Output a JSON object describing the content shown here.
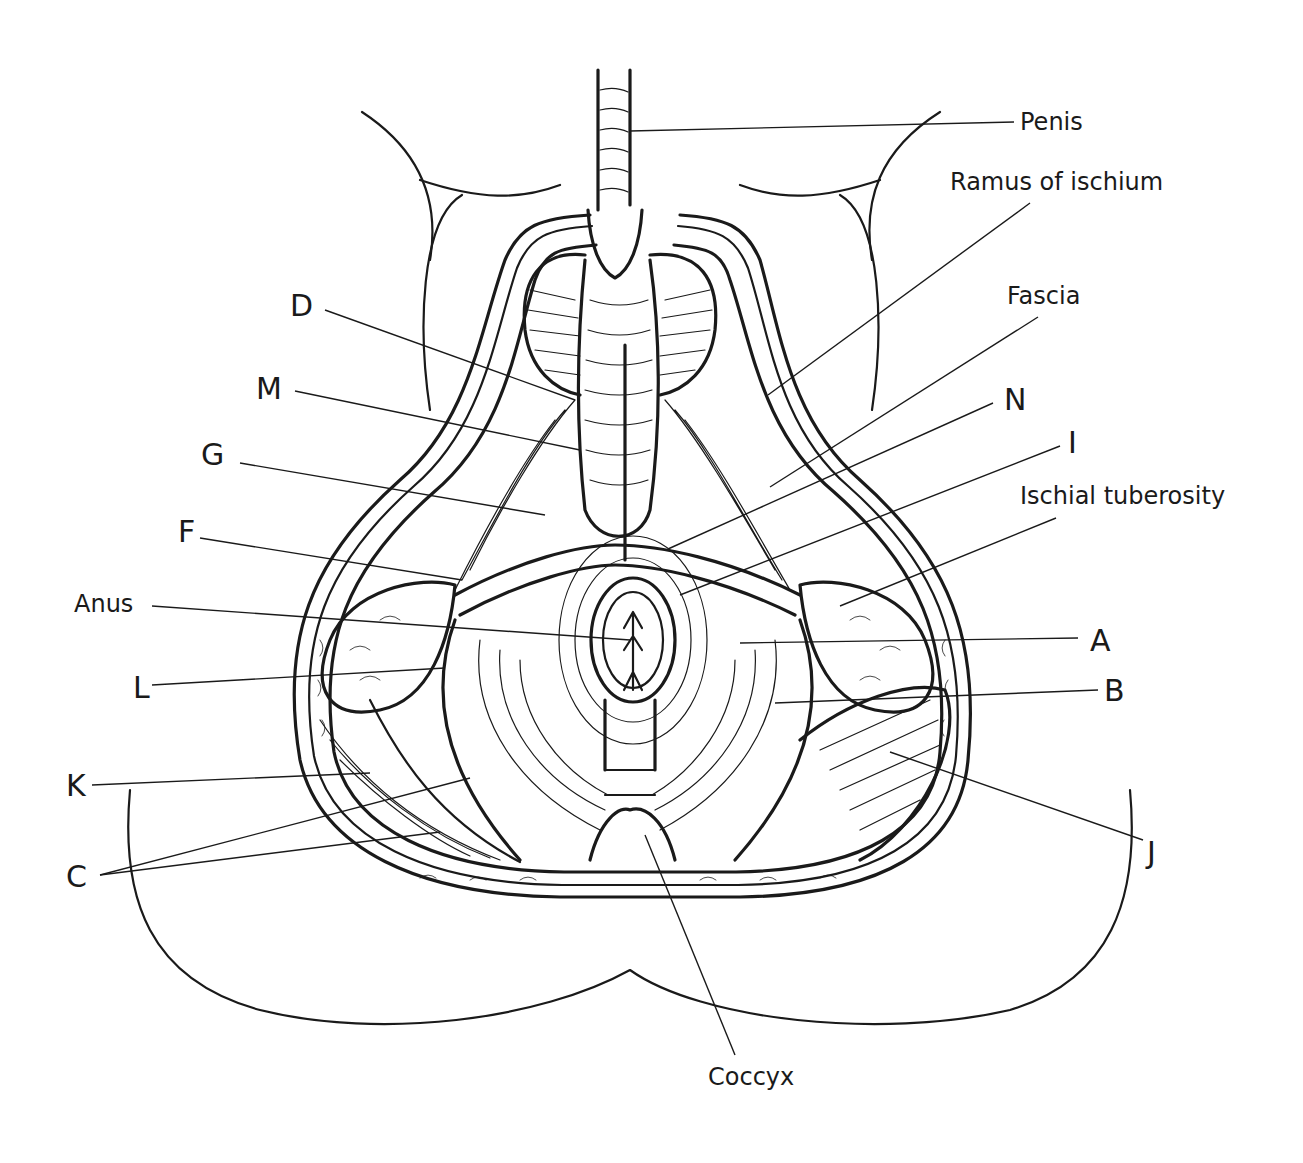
{
  "figure": {
    "type": "anatomical-line-drawing",
    "background": "#ffffff",
    "ink": "#1a1a1a"
  },
  "labels": [
    {
      "id": "penis",
      "text": "Penis",
      "kind": "word",
      "x": 1020,
      "y": 110,
      "line": [
        [
          630,
          131
        ],
        [
          1014,
          122
        ]
      ]
    },
    {
      "id": "ramus",
      "text": "Ramus of ischium",
      "kind": "word",
      "x": 950,
      "y": 170,
      "line": [
        [
          768,
          395
        ],
        [
          1030,
          203
        ]
      ]
    },
    {
      "id": "fascia",
      "text": "Fascia",
      "kind": "word",
      "x": 1007,
      "y": 284,
      "line": [
        [
          770,
          487
        ],
        [
          1038,
          317
        ]
      ]
    },
    {
      "id": "N",
      "text": "N",
      "kind": "letter",
      "x": 1004,
      "y": 385,
      "line": [
        [
          668,
          549
        ],
        [
          993,
          403
        ]
      ]
    },
    {
      "id": "I",
      "text": "I",
      "kind": "letter",
      "x": 1068,
      "y": 428,
      "line": [
        [
          680,
          595
        ],
        [
          1060,
          446
        ]
      ]
    },
    {
      "id": "ischial",
      "text": "Ischial tuberosity",
      "kind": "word",
      "x": 1020,
      "y": 484,
      "line": [
        [
          840,
          606
        ],
        [
          1056,
          518
        ]
      ]
    },
    {
      "id": "A",
      "text": "A",
      "kind": "letter",
      "x": 1090,
      "y": 626,
      "line": [
        [
          740,
          643
        ],
        [
          1078,
          638
        ]
      ]
    },
    {
      "id": "B",
      "text": "B",
      "kind": "letter",
      "x": 1104,
      "y": 676,
      "line": [
        [
          775,
          703
        ],
        [
          1098,
          690
        ]
      ]
    },
    {
      "id": "J",
      "text": "J",
      "kind": "letter",
      "x": 1147,
      "y": 838,
      "line": [
        [
          890,
          752
        ],
        [
          1143,
          840
        ]
      ]
    },
    {
      "id": "D",
      "text": "D",
      "kind": "letter",
      "x": 290,
      "y": 291,
      "line": [
        [
          325,
          310
        ],
        [
          575,
          400
        ]
      ]
    },
    {
      "id": "M",
      "text": "M",
      "kind": "letter",
      "x": 256,
      "y": 374,
      "line": [
        [
          295,
          391
        ],
        [
          580,
          450
        ]
      ]
    },
    {
      "id": "G",
      "text": "G",
      "kind": "letter",
      "x": 201,
      "y": 440,
      "line": [
        [
          240,
          463
        ],
        [
          545,
          515
        ]
      ]
    },
    {
      "id": "F",
      "text": "F",
      "kind": "letter",
      "x": 178,
      "y": 517,
      "line": [
        [
          200,
          538
        ],
        [
          462,
          580
        ]
      ]
    },
    {
      "id": "anus",
      "text": "Anus",
      "kind": "word",
      "x": 74,
      "y": 592,
      "line": [
        [
          152,
          606
        ],
        [
          630,
          640
        ]
      ]
    },
    {
      "id": "L",
      "text": "L",
      "kind": "letter",
      "x": 133,
      "y": 673,
      "line": [
        [
          152,
          685
        ],
        [
          445,
          668
        ]
      ]
    },
    {
      "id": "K",
      "text": "K",
      "kind": "letter",
      "x": 66,
      "y": 771,
      "line": [
        [
          92,
          785
        ],
        [
          370,
          773
        ]
      ]
    },
    {
      "id": "C",
      "text": "C",
      "kind": "letter",
      "x": 66,
      "y": 862,
      "lines": [
        [
          [
            100,
            875
          ],
          [
            470,
            778
          ]
        ],
        [
          [
            100,
            875
          ],
          [
            440,
            832
          ]
        ]
      ]
    },
    {
      "id": "coccyx",
      "text": "Coccyx",
      "kind": "word",
      "x": 708,
      "y": 1065,
      "line": [
        [
          645,
          835
        ],
        [
          735,
          1055
        ]
      ]
    }
  ]
}
